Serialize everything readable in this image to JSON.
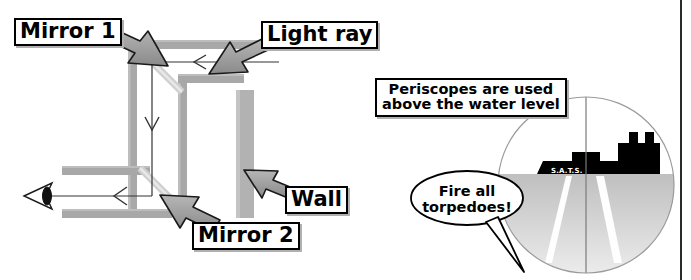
{
  "figure": {
    "panels": [
      {
        "name": "periscope-ray-diagram"
      },
      {
        "name": "periscope-view"
      }
    ]
  },
  "left_panel": {
    "labels": {
      "mirror1": "Mirror 1",
      "light_ray": "Light ray",
      "mirror2": "Mirror 2",
      "wall": "Wall"
    },
    "icons": {
      "eye": "eye-icon",
      "pointer_arrow": "callout-arrow-icon",
      "ray_arrowhead": "ray-direction-arrow-icon"
    },
    "colors": {
      "wall_fill": "#a8a8a8",
      "wall_edge": "#8f8f8f",
      "arrow_fill": "#8c8c8c",
      "arrow_stroke": "#1a1a1a",
      "mirror_line": "#c9c9c9",
      "ray_line": "#333333",
      "label_border": "#000000",
      "label_shadow": "#b0b0b0"
    }
  },
  "right_panel": {
    "caption": {
      "line1": "Periscopes are used",
      "line2": "above the water level"
    },
    "speech_bubble": {
      "line1": "Fire all",
      "line2": "torpedoes!"
    },
    "ship": {
      "name": "S.A.T.S.",
      "icons": {
        "hull": "ship-hull-icon",
        "funnels": "ship-funnel-icon",
        "superstructure": "ship-superstructure-icon"
      }
    },
    "view": {
      "crosshair": "crosshair-icon",
      "water_label": "water-surface",
      "wake_streaks": 2
    },
    "colors": {
      "sky": "#ffffff",
      "water_top": "#c9c9c9",
      "water_bottom": "#e4e4e4",
      "ship_fill": "#000000",
      "circle_outline": "#9a9a9a",
      "crosshair_line": "#808080",
      "wake_fill": "#ffffff",
      "divider": "#2b2b2b"
    }
  },
  "divider": {
    "name": "panel-divider",
    "x": 681
  }
}
